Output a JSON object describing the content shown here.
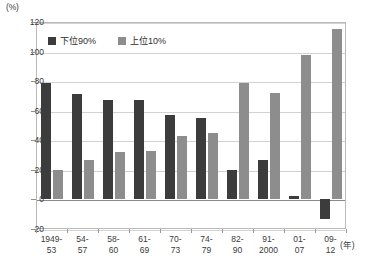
{
  "chart_data": {
    "type": "bar",
    "title": "",
    "xlabel": "(年)",
    "ylabel": "(%)",
    "ylim": [
      -20,
      120
    ],
    "yticks": [
      120,
      100,
      80,
      60,
      40,
      20,
      0,
      -20
    ],
    "grid": true,
    "legend_position": "top-left",
    "categories": [
      "1949-53",
      "54-57",
      "58-60",
      "61-69",
      "70-73",
      "74-79",
      "82-90",
      "91-2000",
      "01-07",
      "09-12"
    ],
    "category_lines": [
      [
        "1949-",
        "53"
      ],
      [
        "54-",
        "57"
      ],
      [
        "58-",
        "60"
      ],
      [
        "61-",
        "69"
      ],
      [
        "70-",
        "73"
      ],
      [
        "74-",
        "79"
      ],
      [
        "82-",
        "90"
      ],
      [
        "91-",
        "2000"
      ],
      [
        "01-",
        "07"
      ],
      [
        "09-",
        "12"
      ]
    ],
    "series": [
      {
        "name": "下位90%",
        "color": "#3c3c3c",
        "values": [
          79,
          71,
          67,
          67,
          57,
          55,
          20,
          27,
          2,
          -13
        ]
      },
      {
        "name": "上位10%",
        "color": "#8d8d8d",
        "values": [
          20,
          27,
          32,
          33,
          43,
          45,
          79,
          72,
          98,
          115
        ]
      }
    ]
  },
  "axis": {
    "unit_label": "(%)",
    "year_label": "(年)"
  }
}
